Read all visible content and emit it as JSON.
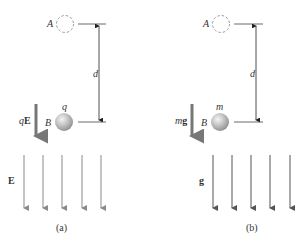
{
  "panels": [
    {
      "id": "a",
      "caption": "(a)",
      "point_a": "A",
      "point_b": "B",
      "distance_label": "d",
      "particle_label": "q",
      "force_label_prefix": "q",
      "force_label_vec": "E",
      "field_label": "E",
      "field_color": "#8a8a8a"
    },
    {
      "id": "b",
      "caption": "(b)",
      "point_a": "A",
      "point_b": "B",
      "distance_label": "d",
      "particle_label": "m",
      "force_label_prefix": "m",
      "force_label_vec": "g",
      "field_label": "g",
      "field_color": "#555555"
    }
  ]
}
